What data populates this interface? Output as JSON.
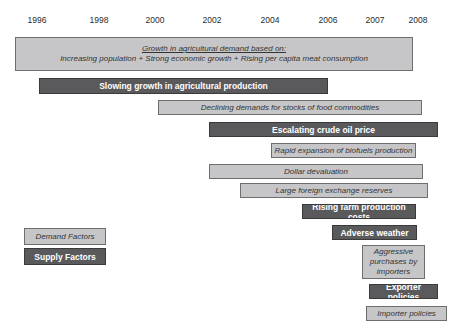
{
  "years": [
    {
      "label": "1996",
      "x": 37
    },
    {
      "label": "1998",
      "x": 99
    },
    {
      "label": "2000",
      "x": 155
    },
    {
      "label": "2002",
      "x": 212
    },
    {
      "label": "2004",
      "x": 270
    },
    {
      "label": "2006",
      "x": 328
    },
    {
      "label": "2007",
      "x": 375
    },
    {
      "label": "2008",
      "x": 418
    }
  ],
  "main_demand": {
    "title": "Growth in agricultural demand based on:",
    "subtitle": "Increasing population + Strong economic growth + Rising per capita meat consumption"
  },
  "bars": [
    {
      "label": "Slowing growth in agricultural production",
      "type": "supply"
    },
    {
      "label": "Declining demands for stocks of food commodities",
      "type": "demand"
    },
    {
      "label": "Escalating crude oil price",
      "type": "supply"
    },
    {
      "label": "Rapid expansion of biofuels production",
      "type": "demand"
    },
    {
      "label": "Dollar devaluation",
      "type": "demand"
    },
    {
      "label": "Large foreign exchange reserves",
      "type": "demand"
    },
    {
      "label": "Rising farm production costs",
      "type": "supply"
    },
    {
      "label": "Adverse weather",
      "type": "supply"
    },
    {
      "label": "Aggressive purchases by importers",
      "type": "demand"
    },
    {
      "label": "Exporter policies",
      "type": "supply"
    },
    {
      "label": "Importer policies",
      "type": "demand"
    }
  ],
  "legend": {
    "demand": "Demand Factors",
    "supply": "Supply Factors"
  },
  "colors": {
    "demand_fill": "#c6c6c9",
    "supply_fill": "#5a5a5c"
  }
}
